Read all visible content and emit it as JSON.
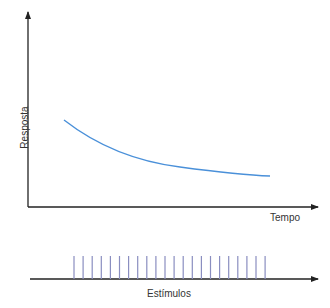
{
  "diagram": {
    "top_plot": {
      "y_axis_label": "Resposta",
      "x_axis_label": "Tempo",
      "curve": {
        "type": "decaying-exponential",
        "color": "#4a90d9",
        "description": "Response decreasing over time (habituation)",
        "points": [
          [
            64,
            120
          ],
          [
            90,
            138
          ],
          [
            120,
            152
          ],
          [
            150,
            161
          ],
          [
            180,
            167
          ],
          [
            210,
            171
          ],
          [
            240,
            174
          ],
          [
            270,
            176
          ]
        ]
      }
    },
    "bottom_plot": {
      "x_axis_label": "Estímulos",
      "stimulus_count": 22,
      "stimulus_color": "#8a8ec0",
      "stimulus_first_x": 74,
      "stimulus_spacing": 9.1
    },
    "axis_color": "#222222"
  }
}
